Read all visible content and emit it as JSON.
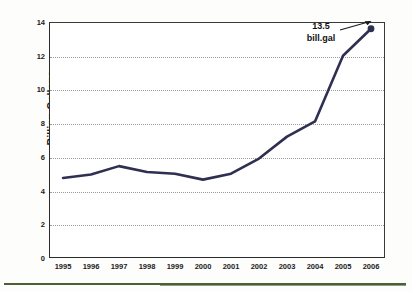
{
  "chart_data": {
    "type": "line",
    "title": "",
    "xlabel": "",
    "ylabel": "Billion Gallons",
    "categories": [
      "1995",
      "1996",
      "1997",
      "1998",
      "1999",
      "2000",
      "2001",
      "2002",
      "2003",
      "2004",
      "2005",
      "2006"
    ],
    "values": [
      4.75,
      4.95,
      5.45,
      5.1,
      5.0,
      4.65,
      5.0,
      5.9,
      7.2,
      8.1,
      12.0,
      13.6
    ],
    "series": [
      {
        "name": "Billion Gallons",
        "values": [
          4.75,
          4.95,
          5.45,
          5.1,
          5.0,
          4.65,
          5.0,
          5.9,
          7.2,
          8.1,
          12.0,
          13.6
        ]
      }
    ],
    "ylim": [
      0,
      14
    ],
    "yticks": [
      0,
      2,
      4,
      6,
      8,
      10,
      12,
      14
    ],
    "ytick_labels": [
      "0",
      "2",
      "4",
      "6",
      "8",
      "10",
      "12",
      "14"
    ],
    "grid": "horizontal-dotted",
    "legend": "none",
    "line_color": "#2f2f52",
    "marker_last_point": true,
    "annotations": [
      {
        "label_line1": "13.5",
        "label_line2": "bill.gal",
        "points_to_category": "2006",
        "points_to_value": 13.6
      }
    ]
  },
  "decor": {
    "rule_color": "#4a6138"
  }
}
